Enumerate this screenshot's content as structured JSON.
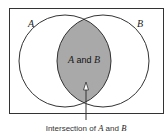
{
  "diagram": {
    "sets": [
      {
        "name": "A",
        "label": "A"
      },
      {
        "name": "B",
        "label": "B"
      }
    ],
    "intersection_label": {
      "set1": "A",
      "and": " and ",
      "set2": "B"
    },
    "caption": {
      "prefix": "Intersection of ",
      "set1": "A",
      "and": " and ",
      "set2": "B"
    },
    "colors": {
      "outline": "#333333",
      "intersection_fill": "#a9a9a9",
      "background": "#ffffff"
    }
  }
}
